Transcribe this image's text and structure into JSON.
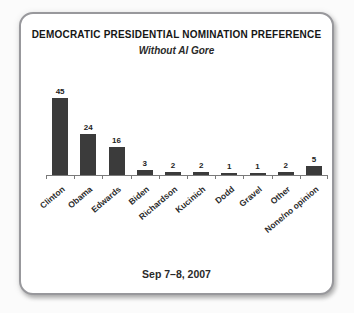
{
  "page": {
    "background_color": "#fbfbfb"
  },
  "card": {
    "title": "DEMOCRATIC PRESIDENTIAL NOMINATION PREFERENCE",
    "subtitle": "Without Al Gore",
    "caption": "Sep 7–8, 2007",
    "border_color": "#98989c",
    "background_color": "#ffffff"
  },
  "chart_data": {
    "type": "bar",
    "title": "DEMOCRATIC PRESIDENTIAL NOMINATION PREFERENCE",
    "subtitle": "Without Al Gore",
    "caption": "Sep 7–8, 2007",
    "categories": [
      "Clinton",
      "Obama",
      "Edwards",
      "Biden",
      "Richardson",
      "Kucinich",
      "Dodd",
      "Gravel",
      "Other",
      "None/no opinion"
    ],
    "values": [
      45,
      24,
      16,
      3,
      2,
      2,
      1,
      1,
      2,
      5
    ],
    "xlabel": "",
    "ylabel": "",
    "ylim": [
      0,
      50
    ],
    "grid": false,
    "legend": false,
    "value_labels_shown": true,
    "x_label_rotation_deg": 40,
    "bar_color": "#3b3b3b",
    "axis_color": "#7a7a7a",
    "label_color": "#2b2b2b"
  }
}
